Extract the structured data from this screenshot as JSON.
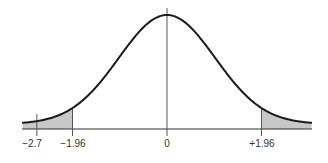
{
  "chart_data": {
    "type": "area",
    "title": "",
    "xlabel": "",
    "ylabel": "",
    "curve": "normal",
    "mean": 0,
    "sd": 1,
    "xlim": [
      -3.0,
      3.0
    ],
    "grid": false,
    "markers": [
      {
        "x": -2.7,
        "label": "−2.7"
      },
      {
        "x": -1.96,
        "label": "−1.96"
      },
      {
        "x": 0,
        "label": "0"
      },
      {
        "x": 1.96,
        "label": "+1.96"
      }
    ],
    "shaded_regions": [
      {
        "from": -3.0,
        "to": -1.96
      },
      {
        "from": 1.96,
        "to": 3.0
      }
    ],
    "colors": {
      "curve": "#1a1a1a",
      "shade": "#c8c8c8",
      "axis": "#333333",
      "marker": "#555555"
    }
  },
  "labels": {
    "m_neg27": "−2.7",
    "m_neg196": "−1.96",
    "m_zero": "0",
    "m_pos196": "+1.96"
  }
}
